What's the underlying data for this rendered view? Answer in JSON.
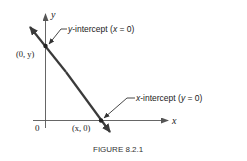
{
  "figure": {
    "caption": "FIGURE 8.2.1",
    "axes": {
      "x_label": "x",
      "y_label": "y",
      "origin_label": "0"
    },
    "points": {
      "y_intercept_coord": "(0, y)",
      "x_intercept_coord": "(x, 0)"
    },
    "annotations": {
      "y_intercept": {
        "term": "y",
        "rest": "-intercept (",
        "var": "x",
        "eq": " = 0)"
      },
      "x_intercept": {
        "term": "x",
        "rest": "-intercept (",
        "var": "y",
        "eq": " = 0)"
      }
    },
    "colors": {
      "line": "#3a3a3a",
      "axis": "#555555",
      "text": "#222222",
      "caption": "#333333"
    }
  }
}
